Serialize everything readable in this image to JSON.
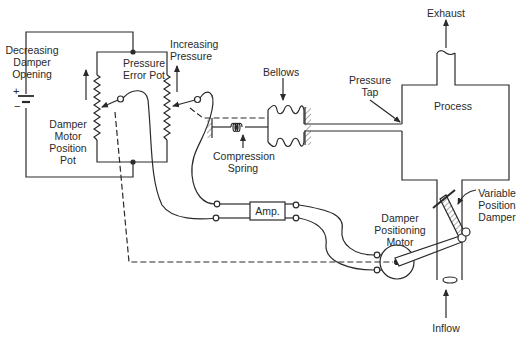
{
  "diagram": {
    "type": "control-system-schematic",
    "colors": {
      "line": "#2a2a2a",
      "background": "#ffffff"
    },
    "labels": {
      "decreasing_damper_opening": [
        "Decreasing",
        "Damper",
        "Opening"
      ],
      "pressure_error_pot": [
        "Pressure",
        "Error Pot"
      ],
      "increasing_pressure": [
        "Increasing",
        "Pressure"
      ],
      "damper_motor_position_pot": [
        "Damper",
        "Motor",
        "Position",
        "Pot"
      ],
      "battery_plus": "+",
      "battery_minus": "−",
      "bellows": "Bellows",
      "compression_spring": [
        "Compression",
        "Spring"
      ],
      "pressure_tap": [
        "Pressure",
        "Tap"
      ],
      "exhaust": "Exhaust",
      "process": "Process",
      "amp": "Amp.",
      "damper_positioning_motor": [
        "Damper",
        "Positioning",
        "Motor"
      ],
      "variable_position_damper": [
        "Variable",
        "Position",
        "Damper"
      ],
      "inflow": "Inflow"
    }
  }
}
